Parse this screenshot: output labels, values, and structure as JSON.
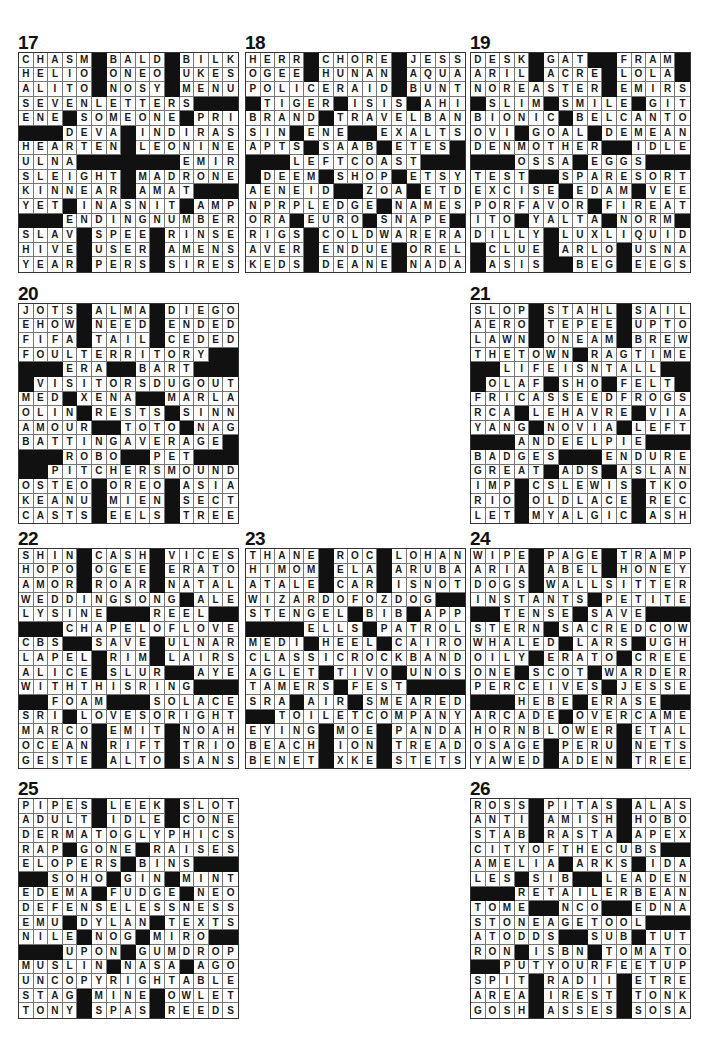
{
  "page": {
    "puzzles": [
      {
        "number": "17",
        "rows": [
          "CHASM#BALD#BILK",
          "HELIO#ONEO#UKES",
          "ALITO#NOSY#MENU",
          "SEVENLETTERS###",
          "ENE#SOMEONE#PRI",
          "###DEVA#INDIRAS",
          "HEARTEN#LEONINE",
          "ULNA#######EMIR",
          "SLEIGHT#MADRONE",
          "KINNEAR#AMAT###",
          "YET#INASNIT#AMP",
          "###ENDINGNUMBER",
          "SLAV#SPEE#RINSE",
          "HIVE#USER#AMENS",
          "YEAR#PERS#SIRES"
        ]
      },
      {
        "number": "18",
        "rows": [
          "HERR#CHORE#JESS",
          "OGEE#HUNAN#AQUA",
          "POLICERAID#BUNT",
          "#TIGER#ISIS#AHI",
          "BRAND#TRAVELBAN",
          "SIN#ENE##EXALTS",
          "APTS#SAAB#ETES#",
          "###LEFTCOAST###",
          "#DEEM#SHOP#ETSY",
          "AENEID##ZOA#ETD",
          "NPRPLEDGE#NAMES",
          "ORA#EURO#SNAPE#",
          "RIGS#COLDWARERA",
          "AVER#ENDUE#OREL",
          "KEDS#DEANE#NADA"
        ]
      },
      {
        "number": "19",
        "rows": [
          "DESK#GAT##FRAM#",
          "ARIL#ACRE#LOLA#",
          "NOREASTER#EMIRS",
          "#SLIM#SMILE#GIT",
          "BIONIC#BELCANTO",
          "OVI#GOAL#DEMEAN",
          "DENMOTHER##IDLE",
          "###OSSA#EGGS###",
          "TEST##SPARESORT",
          "EXCISE#EDAM#VEE",
          "PORFAVOR#FIREAT",
          "ITO#YALTA#NORM#",
          "DILLY#LUXLIQUID",
          "#CLUE#ARLO#USNA",
          "#ASIS##BEG#EEGS"
        ]
      },
      {
        "number": "20",
        "rows": [
          "JOTS#ALMA#DIEGO",
          "EHOW#NEED#ENDED",
          "FIFA#TAIL#CEDED",
          "FOULTERRITORY##",
          "###ERA##BART###",
          "#VISITORSDUGOUT",
          "MED#XENA##MARLA",
          "OLIN#RESTS#SINN",
          "AMOUR##TOTO#NAG",
          "BATTINGAVERAGE#",
          "###ROBO##PET###",
          "##PITCHERSMOUND",
          "OSTEO#OREO#ASIA",
          "KEANU#MIEN#SECT",
          "CASTS#EELS#TREE"
        ]
      },
      {
        "number": "21",
        "rows": [
          "SLOP#STAHL#SAIL",
          "AERO#TEPEE#UPTO",
          "LAWN#ONEAM#BREW",
          "THETOWN#RAGTIME",
          "##LIFEISNTALL##",
          "#OLAF#SHO#FELT#",
          "FRICASSEEDFROGS",
          "RCA#LEHAVRE#VIA",
          "YANG#NOVIA#LEFT",
          "###ANDEELPIE###",
          "BADGES###ENDURE",
          "GREAT#ADS#ASLAN",
          "IMP#CSLEWIS#TKO",
          "RIO#OLDLACE#REC",
          "LET#MYALGIC#ASH"
        ]
      },
      {
        "number": "22",
        "rows": [
          "SHIN#CASH#VICES",
          "HOPO#OGEE#ERATO",
          "AMOR#ROAR#NATAL",
          "WEDDINGSONG#ALE",
          "LYSINE###REEL##",
          "###CHAPELOFLOVE",
          "CBS##SAVE#ULNAR",
          "LAPEL#RIM#LAIRS",
          "ALICE#SLUR##AYE",
          "WITHTHISRING###",
          "##FOAM###SOLACE",
          "SRI#LOVESORIGHT",
          "MARCO#EMIT#NOAH",
          "OCEAN#RIFT#TRIO",
          "GESTE#ALTO#SANS"
        ]
      },
      {
        "number": "23",
        "rows": [
          "THANE#ROC#LOHAN",
          "HIMOM#ELA#ARUBA",
          "ATALE#CAR#ISNOT",
          "WIZARDOFOZDOG##",
          "STENGEL#BIB#APP",
          "####ELLS#PATROL",
          "MEDI#HEEL#CAIRO",
          "CLASSICROCKBAND",
          "AGLET#TIVO#UNOS",
          "TAMERS#FEST####",
          "SRA#AIR#SMEARED",
          "##TOILETCOMPANY",
          "EYING#MOE#PANDA",
          "BEACH#ION#TREAD",
          "BENET#XKE#STETS"
        ]
      },
      {
        "number": "24",
        "rows": [
          "WIPE#PAGE#TRAMP",
          "ARIA#ABEL#HONEY",
          "DOGS#WALLSITTER",
          "INSTANTS#PETITE",
          "##TENSE#SAVE###",
          "STERN#SACREDCOW",
          "WHALED#LARS#UGH",
          "OILY#ERATO#CREE",
          "ONE#SCOT#WARDER",
          "PERCEIVES#JESSE",
          "###HEBE#ERASE##",
          "ARCADE#OVERCAME",
          "HORNBLOWER#ETAL",
          "OSAGE#PERU#NETS",
          "YAWED#ADEN#TREE"
        ]
      },
      {
        "number": "25",
        "rows": [
          "PIPES#LEEK#SLOT",
          "ADULT#IDLE#CONE",
          "DERMATOGLYPHICS",
          "RAP#GONE#RAISES",
          "ELOPERS#BINS###",
          "##SOHO#GIN#MINT",
          "EDEMA#FUDGE#NEO",
          "DEFENSELESSNESS",
          "EMU#DYLAN#TEXTS",
          "NILE#NOG#MIRO##",
          "###UPON#GUMDROP",
          "MUSLIN#NASA#AGO",
          "UNCOPYRIGHTABLE",
          "STAG#MINE#OWLET",
          "TONY#SPAS#REEDS"
        ]
      },
      {
        "number": "26",
        "rows": [
          "ROSS#PITAS#ALAS",
          "ANTI#AMISH#HOBO",
          "STAB#RASTA#APEX",
          "CITYOFTHECUBS##",
          "AMELIA#ARKS#IDA",
          "LES#SIB##LEADEN",
          "###RETAILERBEAN",
          "TOME##NCO##EDNA",
          "STONEAGETOOL###",
          "ATODDS##SUB#TUT",
          "RON#ISBN#TOMATO",
          "##PUTYOURFEETUP",
          "SPIT#RADII#ETRE",
          "AREA#IREST#TONK",
          "GOSH#ASSES#SOSA"
        ]
      }
    ]
  }
}
